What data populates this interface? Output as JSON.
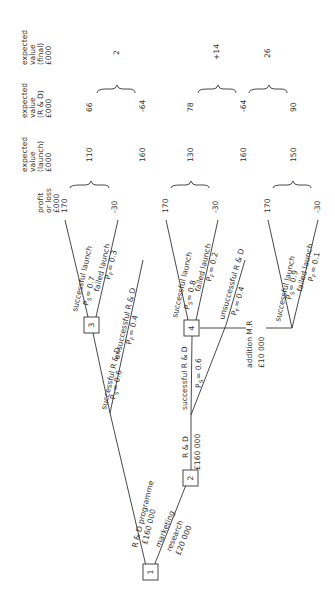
{
  "diagram": {
    "type": "decision-tree",
    "orientation": "rotated -90deg",
    "column_headers": {
      "profit": [
        "profit",
        "or loss",
        "£000"
      ],
      "ev_launch": [
        "expected",
        "value",
        "(launch)",
        "£000"
      ],
      "ev_rd": [
        "expected",
        "value",
        "(R & D)",
        "£000"
      ],
      "ev_final": [
        "expected",
        "value",
        "(final)",
        "£000"
      ]
    },
    "nodes": [
      {
        "id": "1",
        "label": "1"
      },
      {
        "id": "2",
        "label": "2"
      },
      {
        "id": "3",
        "label": "3"
      },
      {
        "id": "4",
        "label": "4"
      }
    ],
    "branches": {
      "rd_programme": {
        "label": "R & D  programme",
        "cost": "£160 000"
      },
      "marketing_research": {
        "label1": "marketing",
        "label2": "research",
        "cost": "£20 000"
      },
      "rd_after_mr": {
        "label": "R & D",
        "cost": "£160 000"
      },
      "top_success_rd": {
        "label": "successful R & D",
        "prob": "= 0.6"
      },
      "top_unsuccess_rd": {
        "label": "unsuccessful R & D",
        "prob": "= 0.4"
      },
      "top_success_launch": {
        "label": "successful launch",
        "prob": "= 0.7"
      },
      "top_failed_launch": {
        "label": "failed launch",
        "prob": "= 0.3"
      },
      "mid_success_rd": {
        "label": "successful R & D",
        "prob": "= 0.6"
      },
      "mid_unsuccess_rd": {
        "label": "unsuccessful R & D",
        "prob": "= 0.4"
      },
      "mid_success_launch": {
        "label": "successful launch",
        "prob": "= 0.8"
      },
      "mid_failed_launch": {
        "label": "failed launch",
        "prob": "= 0.2"
      },
      "additional_mr": {
        "label": "addition M.R",
        "cost": "£10 000"
      },
      "bot_success_launch": {
        "label": "successful launch",
        "prob": "= 0.9"
      },
      "bot_failed_launch": {
        "label": "failed launch",
        "prob": "= 0.1"
      }
    },
    "prob_symbols": {
      "P": "P",
      "S": "S",
      "F": "F"
    },
    "profits": [
      "170",
      "-30",
      "170",
      "-30",
      "170",
      "-30"
    ],
    "ev_launch": [
      "110",
      "160",
      "130",
      "160",
      "150"
    ],
    "ev_rd": [
      "66",
      "-64",
      "78",
      "-64",
      "90"
    ],
    "ev_final": [
      "2",
      "+14",
      "26"
    ]
  }
}
